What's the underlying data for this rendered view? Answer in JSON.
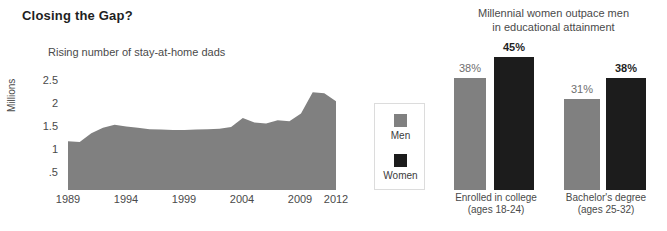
{
  "title": "Closing the Gap?",
  "colors": {
    "men": "#808080",
    "women": "#1c1c1c",
    "text": "#4a4a4a",
    "title": "#1f1f1f",
    "legend_border": "#dcdcdc",
    "background": "#ffffff"
  },
  "legend": {
    "items": [
      {
        "label": "Men",
        "swatch_name": "legend-swatch-men",
        "color": "#808080"
      },
      {
        "label": "Women",
        "swatch_name": "legend-swatch-women",
        "color": "#1c1c1c"
      }
    ]
  },
  "chart_data": [
    {
      "type": "area",
      "title": "Rising number of stay-at-home dads",
      "xlabel": "",
      "ylabel": "Millions",
      "ylim": [
        0,
        2.5
      ],
      "xlim": [
        1989,
        2012
      ],
      "grid": false,
      "legend_position": "none",
      "color": "#808080",
      "ytick_labels": [
        "2.5",
        "2",
        "1.5",
        "1",
        ".5"
      ],
      "ytick_values": [
        2.5,
        2,
        1.5,
        1,
        0.5
      ],
      "xtick_labels": [
        "1989",
        "1994",
        "1999",
        "2004",
        "2009",
        "2012"
      ],
      "xtick_values": [
        1989,
        1994,
        1999,
        2004,
        2009,
        2012
      ],
      "x": [
        1989,
        1990,
        1991,
        1992,
        1993,
        1994,
        1995,
        1996,
        1997,
        1998,
        1999,
        2000,
        2001,
        2002,
        2003,
        2004,
        2005,
        2006,
        2007,
        2008,
        2009,
        2010,
        2011,
        2012
      ],
      "values": [
        1.1,
        1.08,
        1.28,
        1.4,
        1.47,
        1.43,
        1.4,
        1.37,
        1.36,
        1.35,
        1.35,
        1.36,
        1.37,
        1.38,
        1.42,
        1.62,
        1.52,
        1.5,
        1.57,
        1.55,
        1.72,
        2.2,
        2.18,
        2.0
      ]
    },
    {
      "type": "bar",
      "title": "Millennial women outpace men in educational attainment",
      "title_line1": "Millennial women outpace men",
      "title_line2": "in educational attainment",
      "xlabel": "",
      "ylabel": "",
      "ylim": [
        0,
        50
      ],
      "grid": false,
      "legend_position": "left",
      "categories": [
        "Enrolled in college (ages 18-24)",
        "Bachelor's degree (ages 25-32)"
      ],
      "category_labels": [
        {
          "line1": "Enrolled in college",
          "line2": "(ages 18-24)"
        },
        {
          "line1": "Bachelor's degree",
          "line2": "(ages 25-32)"
        }
      ],
      "series": [
        {
          "name": "Men",
          "color": "#808080",
          "values": [
            38,
            31
          ],
          "value_labels": [
            "38%",
            "31%"
          ]
        },
        {
          "name": "Women",
          "color": "#1c1c1c",
          "values": [
            45,
            38
          ],
          "value_labels": [
            "45%",
            "38%"
          ]
        }
      ]
    }
  ]
}
